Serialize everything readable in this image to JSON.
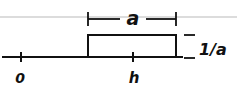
{
  "diagram": {
    "type": "rectangular-pulse",
    "axis": {
      "ticks": [
        {
          "label": "0"
        },
        {
          "label": "h"
        }
      ]
    },
    "pulse": {
      "width_label": "a",
      "height_label": "1/a"
    },
    "colors": {
      "ink": "#111111",
      "paper_line": "#d8d8d8",
      "background": "#ffffff"
    }
  }
}
